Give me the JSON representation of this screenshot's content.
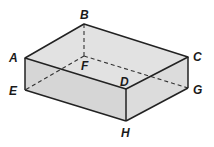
{
  "diagram": {
    "colors": {
      "face": "#d9d9d9",
      "edge": "#222222",
      "hidden_edge": "#333333",
      "background": "#ffffff"
    },
    "vertices": {
      "A": {
        "x": 25,
        "y": 58
      },
      "B": {
        "x": 84,
        "y": 24
      },
      "C": {
        "x": 188,
        "y": 57
      },
      "D": {
        "x": 126,
        "y": 89
      },
      "E": {
        "x": 25,
        "y": 90
      },
      "F": {
        "x": 84,
        "y": 56
      },
      "G": {
        "x": 188,
        "y": 88
      },
      "H": {
        "x": 126,
        "y": 121
      }
    },
    "labels": {
      "A": "A",
      "B": "B",
      "C": "C",
      "D": "D",
      "E": "E",
      "F": "F",
      "G": "G",
      "H": "H"
    },
    "visible_edges": [
      "AB",
      "BC",
      "CD",
      "DA",
      "AE",
      "EH",
      "DH",
      "HG",
      "GC"
    ],
    "hidden_edges": [
      "BF",
      "FE",
      "FG"
    ]
  }
}
